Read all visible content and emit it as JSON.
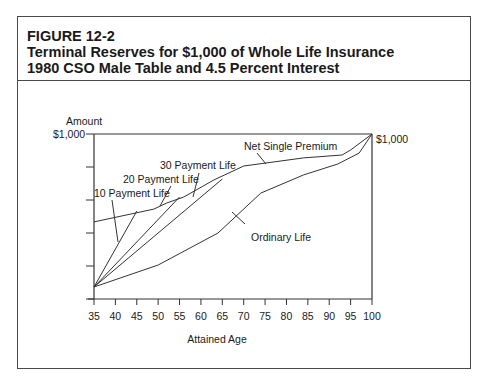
{
  "figure": {
    "label": "FIGURE 12-2",
    "title_line1": "Terminal Reserves for $1,000 of Whole Life Insurance",
    "title_line2": "1980 CSO Male Table and 4.5 Percent Interest"
  },
  "chart_data": {
    "type": "line",
    "title": "Terminal Reserves for $1,000 of Whole Life Insurance",
    "subtitle": "1980 CSO Male Table and 4.5 Percent Interest",
    "xlabel": "Attained Age",
    "ylabel": "Amount",
    "x_ticks": [
      "35",
      "40",
      "45",
      "50",
      "55",
      "60",
      "65",
      "70",
      "75",
      "80",
      "85",
      "90",
      "95",
      "100"
    ],
    "y_tick_label_top": "$1,000",
    "right_label": "$1,000",
    "xlim": [
      35,
      100
    ],
    "ylim": [
      0,
      1000
    ],
    "y_tick_step": 200,
    "grid": false,
    "legend": "inline labels with leader lines",
    "series": [
      {
        "name": "Net Single Premium",
        "x": [
          35,
          49,
          52,
          56,
          63,
          70,
          84,
          93,
          95,
          100
        ],
        "y": [
          467,
          545,
          582,
          618,
          721,
          806,
          855,
          873,
          903,
          1000
        ]
      },
      {
        "name": "10 Payment Life",
        "x": [
          35,
          45
        ],
        "y": [
          73,
          533
        ]
      },
      {
        "name": "20 Payment Life",
        "x": [
          35,
          55
        ],
        "y": [
          73,
          618
        ]
      },
      {
        "name": "30 Payment Life",
        "x": [
          35,
          65
        ],
        "y": [
          73,
          727
        ]
      },
      {
        "name": "Ordinary Life",
        "x": [
          35,
          50,
          64,
          74,
          84,
          92,
          97,
          100
        ],
        "y": [
          73,
          206,
          400,
          642,
          752,
          818,
          885,
          1000
        ]
      }
    ],
    "annotations": [
      {
        "text": "Net Single Premium"
      },
      {
        "text": "30 Payment Life"
      },
      {
        "text": "20 Payment Life"
      },
      {
        "text": "10 Payment Life"
      },
      {
        "text": "Ordinary Life"
      }
    ]
  }
}
